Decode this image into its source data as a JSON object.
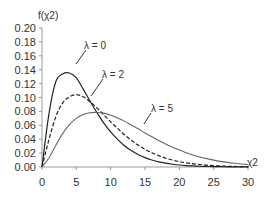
{
  "chart_data": {
    "type": "line",
    "title": "",
    "xlabel": "χ2",
    "ylabel": "f(χ2)",
    "xlim": [
      0,
      30
    ],
    "ylim": [
      0,
      0.2
    ],
    "x_ticks": [
      "0",
      "5",
      "10",
      "15",
      "20",
      "25",
      "30"
    ],
    "y_ticks": [
      "0.00",
      "0.02",
      "0.04",
      "0.06",
      "0.08",
      "0.10",
      "0.12",
      "0.14",
      "0.16",
      "0.18",
      "0.20"
    ],
    "grid": false,
    "legend": "inline annotations",
    "x": [
      0,
      1,
      2,
      3,
      4,
      5,
      6,
      7,
      8,
      9,
      10,
      11,
      12,
      13,
      14,
      15,
      16,
      17,
      18,
      19,
      20,
      21,
      22,
      23,
      24,
      25,
      26,
      27,
      28,
      29,
      30
    ],
    "series": [
      {
        "name": "λ = 0",
        "style": "solid",
        "values": [
          0,
          0.0758,
          0.1226,
          0.1339,
          0.1353,
          0.1283,
          0.112,
          0.0949,
          0.0782,
          0.0632,
          0.0505,
          0.0397,
          0.0307,
          0.0236,
          0.0179,
          0.0135,
          0.0101,
          0.0074,
          0.0055,
          0.004,
          0.0029,
          0.0021,
          0.0015,
          0.0011,
          0.0008,
          0.0005,
          0.0004,
          0.0003,
          0.0002,
          0.0001,
          0.0001
        ]
      },
      {
        "name": "λ = 2",
        "style": "dashed",
        "values": [
          0,
          0.039,
          0.072,
          0.092,
          0.101,
          0.104,
          0.101,
          0.094,
          0.085,
          0.075,
          0.065,
          0.0555,
          0.0465,
          0.0385,
          0.0315,
          0.0255,
          0.0205,
          0.0163,
          0.0128,
          0.01,
          0.0078,
          0.006,
          0.0046,
          0.0035,
          0.0027,
          0.002,
          0.0015,
          0.0011,
          0.0008,
          0.0006,
          0.0005
        ]
      },
      {
        "name": "λ = 5",
        "style": "solid-gray",
        "values": [
          0,
          0.013,
          0.031,
          0.048,
          0.061,
          0.07,
          0.0755,
          0.078,
          0.0785,
          0.0775,
          0.0745,
          0.0705,
          0.066,
          0.0605,
          0.055,
          0.049,
          0.0435,
          0.038,
          0.033,
          0.0285,
          0.0243,
          0.0205,
          0.0173,
          0.0144,
          0.012,
          0.0099,
          0.0081,
          0.0066,
          0.0054,
          0.0044,
          0.0035
        ]
      }
    ],
    "annotations": [
      {
        "text": "λ = 0",
        "x": 5.5,
        "y": 0.175
      },
      {
        "text": "λ = 2",
        "x": 8.5,
        "y": 0.135
      },
      {
        "text": "λ = 5",
        "x": 15.5,
        "y": 0.085
      }
    ]
  },
  "labels": {
    "y_axis_title": "f(χ2)",
    "x_axis_title": "χ2",
    "lambda0": "λ = 0",
    "lambda2": "λ = 2",
    "lambda5": "λ = 5"
  }
}
